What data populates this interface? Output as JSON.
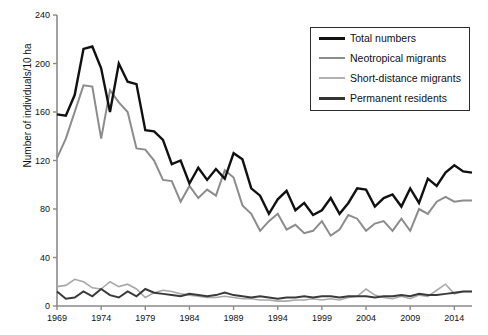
{
  "chart_data": {
    "type": "line",
    "title": "",
    "xlabel": "",
    "ylabel": "Number of individuals/10 ha",
    "xlim": [
      1969,
      2016
    ],
    "ylim": [
      0,
      240
    ],
    "yticks": [
      0,
      40,
      80,
      120,
      160,
      200,
      240
    ],
    "xticks": [
      1969,
      1974,
      1979,
      1984,
      1989,
      1994,
      1999,
      2004,
      2009,
      2014
    ],
    "grid": false,
    "legend_position": "top-right",
    "x": [
      1969,
      1970,
      1971,
      1972,
      1973,
      1974,
      1975,
      1976,
      1977,
      1978,
      1979,
      1980,
      1981,
      1982,
      1983,
      1984,
      1985,
      1986,
      1987,
      1988,
      1989,
      1990,
      1991,
      1992,
      1993,
      1994,
      1995,
      1996,
      1997,
      1998,
      1999,
      2000,
      2001,
      2002,
      2003,
      2004,
      2005,
      2006,
      2007,
      2008,
      2009,
      2010,
      2011,
      2012,
      2013,
      2014,
      2015,
      2016
    ],
    "series": [
      {
        "name": "Total numbers",
        "color": "#111111",
        "width": 2.4,
        "values": [
          158,
          157,
          174,
          212,
          214,
          196,
          160,
          200,
          185,
          183,
          145,
          144,
          137,
          117,
          120,
          101,
          114,
          104,
          113,
          105,
          126,
          121,
          97,
          91,
          76,
          88,
          95,
          79,
          85,
          75,
          79,
          89,
          76,
          85,
          97,
          96,
          82,
          89,
          92,
          82,
          97,
          85,
          105,
          99,
          110,
          116,
          111,
          110
        ]
      },
      {
        "name": "Neotropical migrants",
        "color": "#8c8c8c",
        "width": 2.0,
        "values": [
          122,
          138,
          160,
          182,
          181,
          138,
          178,
          168,
          160,
          130,
          129,
          120,
          104,
          103,
          86,
          99,
          89,
          96,
          91,
          112,
          106,
          83,
          76,
          62,
          70,
          76,
          63,
          67,
          60,
          62,
          70,
          58,
          63,
          75,
          72,
          62,
          68,
          70,
          62,
          72,
          62,
          80,
          76,
          86,
          90,
          86,
          87,
          87
        ]
      },
      {
        "name": "Short-distance migrants",
        "color": "#a8a8a8",
        "width": 1.6,
        "values": [
          16,
          17,
          22,
          20,
          15,
          14,
          20,
          16,
          18,
          14,
          7,
          11,
          13,
          12,
          10,
          9,
          8,
          7,
          7,
          8,
          7,
          6,
          6,
          5,
          5,
          4,
          4,
          5,
          5,
          6,
          5,
          6,
          5,
          7,
          8,
          14,
          9,
          7,
          6,
          8,
          6,
          9,
          8,
          13,
          18,
          10,
          12,
          12
        ]
      },
      {
        "name": "Permanent residents",
        "color": "#3a3a3a",
        "width": 2.0,
        "values": [
          12,
          6,
          7,
          12,
          8,
          14,
          9,
          7,
          12,
          8,
          14,
          11,
          10,
          9,
          8,
          10,
          9,
          8,
          9,
          11,
          9,
          8,
          7,
          8,
          7,
          6,
          7,
          7,
          8,
          7,
          8,
          8,
          7,
          8,
          8,
          8,
          7,
          8,
          8,
          9,
          8,
          10,
          9,
          9,
          10,
          11,
          12,
          12
        ]
      }
    ]
  },
  "legend": {
    "items": [
      {
        "label": "Total numbers",
        "color": "#111111",
        "thickness": 3
      },
      {
        "label": "Neotropical migrants",
        "color": "#8c8c8c",
        "thickness": 2
      },
      {
        "label": "Short-distance migrants",
        "color": "#b0b0b0",
        "thickness": 2
      },
      {
        "label": "Permanent residents",
        "color": "#333333",
        "thickness": 3
      }
    ]
  },
  "axes": {
    "y_tick_labels": [
      "240",
      "200",
      "160",
      "120",
      "80",
      "40",
      "0"
    ],
    "x_tick_labels": [
      "1969",
      "1974",
      "1979",
      "1984",
      "1989",
      "1994",
      "1999",
      "2004",
      "2009",
      "2014"
    ],
    "axis_color": "#8a8a8a"
  }
}
